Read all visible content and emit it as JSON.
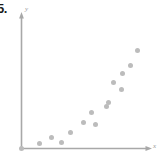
{
  "figure": {
    "problem_number": "5.",
    "background_color": "#ffffff",
    "point_color": "#bcbcbc",
    "axis_color": "#a8a8a8",
    "label_color": "#9a9a9a"
  },
  "chart_data": {
    "type": "scatter",
    "title": "",
    "subtitle": "",
    "xlabel": "x",
    "ylabel": "y",
    "grid": false,
    "legend": null,
    "xlim": [
      0,
      100
    ],
    "ylim": [
      0,
      100
    ],
    "axis_style": "arrow-headed first-quadrant axes, no tick marks, no tick labels",
    "annotations": [
      "5."
    ],
    "series": [
      {
        "name": "data",
        "marker": "filled circle",
        "color": "#bcbcbc",
        "points": [
          {
            "x": 0.0,
            "y": 0.0
          },
          {
            "x": 15.0,
            "y": 4.0
          },
          {
            "x": 25.0,
            "y": 8.5
          },
          {
            "x": 33.5,
            "y": 4.5
          },
          {
            "x": 41.0,
            "y": 13.0
          },
          {
            "x": 51.5,
            "y": 20.5
          },
          {
            "x": 58.5,
            "y": 28.5
          },
          {
            "x": 62.0,
            "y": 19.0
          },
          {
            "x": 70.5,
            "y": 33.5
          },
          {
            "x": 72.5,
            "y": 36.5
          },
          {
            "x": 76.5,
            "y": 52.5
          },
          {
            "x": 83.0,
            "y": 47.0
          },
          {
            "x": 84.0,
            "y": 59.5
          },
          {
            "x": 90.5,
            "y": 65.5
          },
          {
            "x": 96.5,
            "y": 77.5
          }
        ]
      }
    ]
  }
}
